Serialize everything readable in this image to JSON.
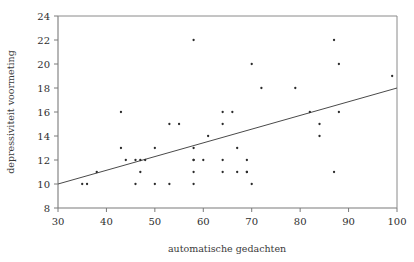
{
  "figure": {
    "title": "",
    "background_color": "#ffffff",
    "point_color": "#2b2b2b",
    "line_color": "#4a4a4a",
    "axis_color": "#7a7a7a"
  },
  "chart_data": {
    "type": "scatter",
    "title": "",
    "subtitle": "",
    "xlabel": "automatische gedachten",
    "ylabel": "depressiviteit voormeting",
    "xlim": [
      30,
      100
    ],
    "ylim": [
      8,
      24
    ],
    "xticks": [
      30,
      40,
      50,
      60,
      70,
      80,
      90,
      100
    ],
    "yticks": [
      8,
      10,
      12,
      14,
      16,
      18,
      20,
      22,
      24
    ],
    "xtick_labels": [
      "30",
      "40",
      "50",
      "60",
      "70",
      "80",
      "90",
      "100"
    ],
    "ytick_labels": [
      "8",
      "10",
      "12",
      "14",
      "16",
      "18",
      "20",
      "22",
      "24"
    ],
    "grid": false,
    "legend": null,
    "series": [
      {
        "name": "observaties",
        "marker": "dot",
        "x": [
          35,
          36,
          38,
          43,
          43,
          44,
          46,
          46,
          47,
          47,
          48,
          50,
          50,
          53,
          53,
          55,
          58,
          58,
          58,
          58,
          58,
          58,
          60,
          61,
          64,
          64,
          64,
          64,
          66,
          67,
          67,
          69,
          69,
          69,
          70,
          70,
          72,
          79,
          82,
          84,
          84,
          87,
          87,
          88,
          88,
          99
        ],
        "y": [
          10,
          10,
          11,
          16,
          13,
          12,
          10,
          12,
          11,
          12,
          12,
          10,
          13,
          15,
          10,
          15,
          22,
          13,
          12,
          11,
          10,
          12,
          12,
          14,
          16,
          15,
          12,
          11,
          16,
          13,
          11,
          12,
          11,
          11,
          20,
          10,
          18,
          18,
          16,
          15,
          14,
          22,
          11,
          20,
          16,
          19
        ]
      }
    ],
    "regression_line": {
      "name": "regressielijn",
      "x_start": 30,
      "y_start": 10,
      "x_end": 100,
      "y_end": 18
    }
  }
}
